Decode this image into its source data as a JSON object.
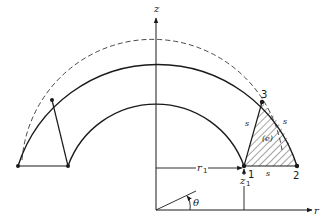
{
  "figure": {
    "type": "axisymmetric ring cross-section with triangular element",
    "axes": {
      "vertical_label": "z",
      "horizontal_label": "r",
      "angle_label": "θ"
    },
    "dimensions": {
      "radial_label": "r",
      "radial_sub": "1",
      "height_label": "z",
      "height_sub": "1"
    },
    "nodes": [
      {
        "id": "1",
        "label": "1"
      },
      {
        "id": "2",
        "label": "2"
      },
      {
        "id": "3",
        "label": "3"
      }
    ],
    "element": {
      "label": "(e)",
      "side_labels": [
        "s",
        "s",
        "s"
      ]
    },
    "colors": {
      "line": "#1a1a1a",
      "background": "#ffffff"
    }
  }
}
